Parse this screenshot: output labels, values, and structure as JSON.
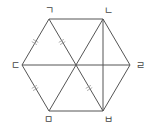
{
  "diagram": {
    "type": "regular-hexagon",
    "colors": {
      "line": "#555555",
      "tick": "#9a9a9a",
      "label": "#444444"
    },
    "vertices": [
      {
        "id": "A",
        "label": "ㄱ",
        "x": 49,
        "y": 19,
        "label_x": 45,
        "label_y": 14
      },
      {
        "id": "B",
        "label": "ㄴ",
        "x": 103,
        "y": 19,
        "label_x": 104,
        "label_y": 14
      },
      {
        "id": "D",
        "label": "ㄹ",
        "x": 130,
        "y": 65,
        "label_x": 136,
        "label_y": 69
      },
      {
        "id": "F",
        "label": "ㅂ",
        "x": 103,
        "y": 111,
        "label_x": 104,
        "label_y": 123
      },
      {
        "id": "E",
        "label": "ㅁ",
        "x": 49,
        "y": 111,
        "label_x": 44,
        "label_y": 123
      },
      {
        "id": "C",
        "label": "ㄷ",
        "x": 22,
        "y": 65,
        "label_x": 11,
        "label_y": 69
      }
    ],
    "center": {
      "x": 76,
      "y": 65
    },
    "diagonals": [
      [
        "A",
        "F"
      ],
      [
        "B",
        "E"
      ],
      [
        "C",
        "D"
      ],
      [
        "B",
        "F"
      ]
    ],
    "equal_marks": [
      {
        "segment": [
          "A",
          "C"
        ],
        "x": 35,
        "y": 42
      },
      {
        "segment": [
          "A",
          "O"
        ],
        "x": 62,
        "y": 42
      },
      {
        "segment": [
          "C",
          "E"
        ],
        "x": 35,
        "y": 88
      },
      {
        "segment": [
          "O",
          "F"
        ],
        "x": 89,
        "y": 88
      }
    ]
  }
}
